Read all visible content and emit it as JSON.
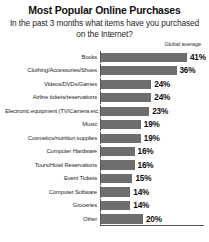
{
  "chart_data": {
    "type": "bar",
    "orientation": "horizontal",
    "title": "Most Popular Online Purchases",
    "subtitle": "In the past 3 months what items have you purchased on the Internet?",
    "legend_label": "Global average",
    "legend_position": "top-right",
    "grid": false,
    "xlabel": "",
    "ylabel": "",
    "xlim": [
      0,
      41
    ],
    "value_suffix": "%",
    "series_name": "Global average",
    "bar_color": "#6e6e6e",
    "categories": [
      "Books",
      "Clothing/Accessories/Shoes",
      "Videos/DVDs/Games",
      "Airline tickets/reservations",
      "Electronic equipment (TV/Camera etc.)",
      "Music",
      "Cosmetics/nutrition supplies",
      "Computer Hardware",
      "Tours/Hotel Reservations",
      "Event Tickets",
      "Computer Software",
      "Groceries",
      "Other"
    ],
    "values": [
      41,
      36,
      24,
      24,
      23,
      19,
      19,
      16,
      16,
      15,
      14,
      14,
      20
    ],
    "value_labels": [
      "41%",
      "36%",
      "24%",
      "24%",
      "23%",
      "19%",
      "19%",
      "16%",
      "16%",
      "15%",
      "14%",
      "14%",
      "20%"
    ]
  }
}
